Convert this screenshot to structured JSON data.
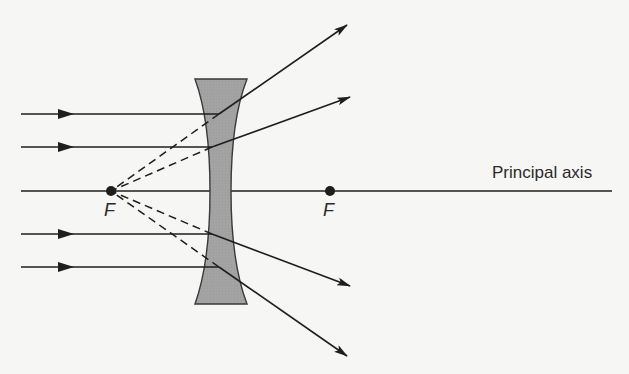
{
  "diagram": {
    "labels": {
      "principal_axis": "Principal axis",
      "focal_left": "F",
      "focal_right": "F"
    },
    "colors": {
      "background": "#f6f6f5",
      "line": "#1e1e1e",
      "lens_fill": "#a3a3a3",
      "lens_stroke": "#3a3a3a",
      "text": "#2a2a2a"
    },
    "principal_axis": {
      "x1": 21,
      "x2": 612,
      "y": 191
    },
    "focal_points": [
      {
        "id": "focal-left",
        "x": 111,
        "y": 191
      },
      {
        "id": "focal-right",
        "x": 330,
        "y": 191
      }
    ],
    "lens": {
      "type": "concave",
      "top_y": 79,
      "bottom_y": 304,
      "top_left_x": 195,
      "top_right_x": 247,
      "waist_left_x": 210,
      "waist_right_x": 231
    },
    "rays": [
      {
        "id": "ray-1",
        "y": 114,
        "start_x": 21,
        "lens_x": 219,
        "end": [
          347,
          25
        ]
      },
      {
        "id": "ray-2",
        "y": 147,
        "start_x": 21,
        "lens_x": 212,
        "end": [
          350,
          97
        ]
      },
      {
        "id": "ray-3",
        "y": 234,
        "start_x": 21,
        "lens_x": 212,
        "end": [
          350,
          286
        ]
      },
      {
        "id": "ray-4",
        "y": 267,
        "start_x": 21,
        "lens_x": 219,
        "end": [
          347,
          356
        ]
      }
    ]
  }
}
